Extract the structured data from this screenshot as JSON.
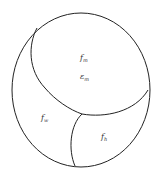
{
  "diagram": {
    "regions": [
      {
        "id": "m",
        "label": "f",
        "subscript": "m",
        "secondary_label": "ε",
        "secondary_subscript": "m"
      },
      {
        "id": "w",
        "label": "f",
        "subscript": "w"
      },
      {
        "id": "h",
        "label": "f",
        "subscript": "h"
      }
    ],
    "colors": {
      "stroke": "#222222",
      "background": "#ffffff"
    }
  }
}
